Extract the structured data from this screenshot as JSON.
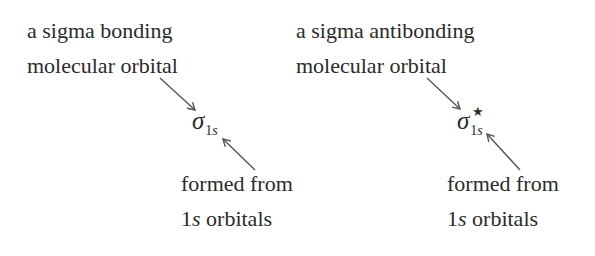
{
  "left": {
    "top_label": [
      "a sigma bonding",
      "molecular orbital"
    ],
    "symbol": "σ",
    "subscript_num": "1",
    "subscript_letter": "s",
    "superscript": "",
    "bottom_label": [
      "formed from",
      "orbitals"
    ],
    "bottom_prefix_num": "1",
    "bottom_prefix_letter": "s"
  },
  "right": {
    "top_label": [
      "a sigma antibonding",
      "molecular orbital"
    ],
    "symbol": "σ",
    "subscript_num": "1",
    "subscript_letter": "s",
    "superscript": "★",
    "bottom_label": [
      "formed from",
      "orbitals"
    ],
    "bottom_prefix_num": "1",
    "bottom_prefix_letter": "s"
  },
  "colors": {
    "text": "#2b2b2b",
    "arrow": "#555555"
  }
}
